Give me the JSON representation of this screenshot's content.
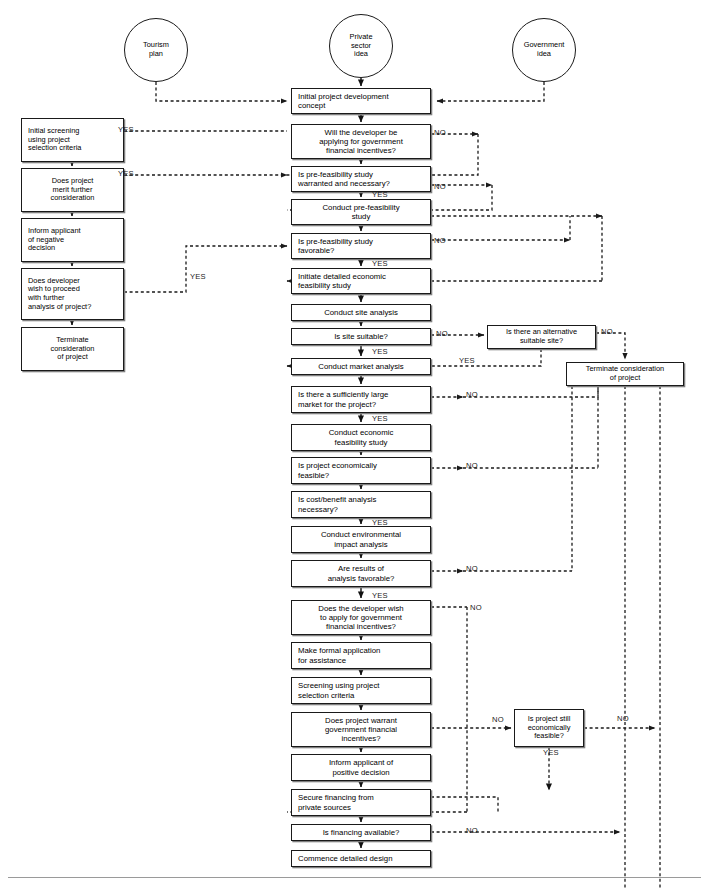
{
  "diagram": {
    "yes_label": "YES",
    "no_label": "NO"
  },
  "sources": [
    {
      "id": "tourism-plan",
      "label": "Tourism\nplan",
      "x": 124,
      "y": 18,
      "w": 64,
      "h": 64
    },
    {
      "id": "private-idea",
      "label": "Private\nsector\nidea",
      "x": 329,
      "y": 14,
      "w": 64,
      "h": 64
    },
    {
      "id": "government-idea",
      "label": "Government\nidea",
      "x": 512,
      "y": 18,
      "w": 64,
      "h": 64
    }
  ],
  "left_column": [
    {
      "id": "initial-screening",
      "label": "Initial screening\nusing project\nselection criteria",
      "x": 21,
      "y": 118,
      "w": 103,
      "h": 44,
      "align": "left"
    },
    {
      "id": "merit-consideration",
      "label": "Does project\nmerit further\nconsideration",
      "x": 21,
      "y": 168,
      "w": 103,
      "h": 44,
      "align": "center"
    },
    {
      "id": "inform-negative",
      "label": "Inform applicant\nof negative\ndecision",
      "x": 21,
      "y": 218,
      "w": 103,
      "h": 44,
      "align": "left"
    },
    {
      "id": "developer-proceed",
      "label": "Does developer\nwish to proceed\nwith further\nanalysis of project?",
      "x": 21,
      "y": 268,
      "w": 103,
      "h": 52,
      "align": "left"
    },
    {
      "id": "terminate-left",
      "label": "Terminate\nconsideration\nof project",
      "x": 21,
      "y": 327,
      "w": 103,
      "h": 44,
      "align": "center"
    }
  ],
  "main_column": [
    {
      "id": "initial-concept",
      "label": "Initial project development\nconcept",
      "x": 291,
      "y": 88,
      "w": 140,
      "h": 26,
      "align": "left"
    },
    {
      "id": "apply-incentives-q",
      "label": "Will the developer be\napplying for government\nfinancial incentives?",
      "x": 291,
      "y": 124,
      "w": 140,
      "h": 35,
      "align": "center"
    },
    {
      "id": "prefeas-warranted-q",
      "label": "Is pre-feasibility study\nwarranted and necessary?",
      "x": 291,
      "y": 166,
      "w": 140,
      "h": 26,
      "align": "left"
    },
    {
      "id": "conduct-prefeas",
      "label": "Conduct pre-feasibility\nstudy",
      "x": 291,
      "y": 199,
      "w": 140,
      "h": 26,
      "align": "center"
    },
    {
      "id": "prefeas-favorable-q",
      "label": "Is pre-feasibility study\nfavorable?",
      "x": 291,
      "y": 233,
      "w": 140,
      "h": 26,
      "align": "left"
    },
    {
      "id": "initiate-economic",
      "label": "Initiate detailed economic\nfeasibility study",
      "x": 291,
      "y": 268,
      "w": 140,
      "h": 26,
      "align": "left"
    },
    {
      "id": "conduct-site",
      "label": "Conduct site analysis",
      "x": 291,
      "y": 304,
      "w": 140,
      "h": 17,
      "align": "center"
    },
    {
      "id": "site-suitable-q",
      "label": "Is site suitable?",
      "x": 291,
      "y": 328,
      "w": 140,
      "h": 17,
      "align": "center"
    },
    {
      "id": "conduct-market",
      "label": "Conduct market analysis",
      "x": 291,
      "y": 358,
      "w": 140,
      "h": 17,
      "align": "center"
    },
    {
      "id": "market-large-q",
      "label": "Is there a sufficiently large\nmarket for the project?",
      "x": 291,
      "y": 386,
      "w": 140,
      "h": 27,
      "align": "left"
    },
    {
      "id": "conduct-econ-study",
      "label": "Conduct economic\nfeasibility study",
      "x": 291,
      "y": 424,
      "w": 140,
      "h": 27,
      "align": "center"
    },
    {
      "id": "econ-feasible-q",
      "label": "Is project economically\nfeasible?",
      "x": 291,
      "y": 457,
      "w": 140,
      "h": 27,
      "align": "left"
    },
    {
      "id": "costbenefit-q",
      "label": "Is cost/benefit analysis\nnecessary?",
      "x": 291,
      "y": 491,
      "w": 140,
      "h": 27,
      "align": "left"
    },
    {
      "id": "conduct-env",
      "label": "Conduct environmental\nimpact analysis",
      "x": 291,
      "y": 526,
      "w": 140,
      "h": 27,
      "align": "center"
    },
    {
      "id": "results-favorable-q",
      "label": "Are results of\nanalysis favorable?",
      "x": 291,
      "y": 560,
      "w": 140,
      "h": 27,
      "align": "center"
    },
    {
      "id": "apply-gov-incentives-q",
      "label": "Does the developer wish\nto apply for government\nfinancial incentives?",
      "x": 291,
      "y": 600,
      "w": 140,
      "h": 35,
      "align": "center"
    },
    {
      "id": "formal-application",
      "label": "Make formal application\nfor assistance",
      "x": 291,
      "y": 642,
      "w": 140,
      "h": 27,
      "align": "left"
    },
    {
      "id": "screening-criteria",
      "label": "Screening using project\nselection criteria",
      "x": 291,
      "y": 677,
      "w": 140,
      "h": 27,
      "align": "left"
    },
    {
      "id": "warrant-incentives-q",
      "label": "Does project warrant\ngovernment financial\nincentives?",
      "x": 291,
      "y": 712,
      "w": 140,
      "h": 35,
      "align": "center"
    },
    {
      "id": "inform-positive",
      "label": "Inform applicant of\npositive decision",
      "x": 291,
      "y": 754,
      "w": 140,
      "h": 27,
      "align": "center"
    },
    {
      "id": "secure-financing",
      "label": "Secure financing from\nprivate sources",
      "x": 291,
      "y": 789,
      "w": 140,
      "h": 27,
      "align": "left"
    },
    {
      "id": "financing-available-q",
      "label": "Is financing available?",
      "x": 291,
      "y": 824,
      "w": 140,
      "h": 17,
      "align": "center"
    },
    {
      "id": "commence-design",
      "label": "Commence detailed design",
      "x": 291,
      "y": 850,
      "w": 140,
      "h": 17,
      "align": "left"
    }
  ],
  "right_column": [
    {
      "id": "alternative-site-q",
      "label": "Is there an alternative\nsuitable site?",
      "x": 487,
      "y": 325,
      "w": 109,
      "h": 24,
      "align": "center"
    },
    {
      "id": "terminate-right",
      "label": "Terminate consideration\nof project",
      "x": 566,
      "y": 362,
      "w": 118,
      "h": 24,
      "align": "center"
    },
    {
      "id": "still-feasible-q",
      "label": "Is project still\neconomically\nfeasible?",
      "x": 514,
      "y": 709,
      "w": 70,
      "h": 38,
      "align": "center"
    }
  ],
  "edge_labels": [
    {
      "id": "yes-initial-screening",
      "text": "YES",
      "x": 118,
      "y": 125
    },
    {
      "id": "yes-merit",
      "text": "YES",
      "x": 118,
      "y": 169
    },
    {
      "id": "yes-developer-proceed",
      "text": "YES",
      "x": 190,
      "y": 272
    },
    {
      "id": "no-apply-incentives",
      "text": "NO",
      "x": 434,
      "y": 128
    },
    {
      "id": "no-prefeas-warranted",
      "text": "NO",
      "x": 434,
      "y": 182
    },
    {
      "id": "yes-prefeas-warranted",
      "text": "YES",
      "x": 372,
      "y": 190
    },
    {
      "id": "no-prefeas-favorable",
      "text": "NO",
      "x": 434,
      "y": 236
    },
    {
      "id": "yes-prefeas-favorable",
      "text": "YES",
      "x": 372,
      "y": 259
    },
    {
      "id": "no-site-suitable",
      "text": "NO",
      "x": 436,
      "y": 329
    },
    {
      "id": "yes-site-suitable",
      "text": "YES",
      "x": 372,
      "y": 347
    },
    {
      "id": "no-alternative-site",
      "text": "NO",
      "x": 601,
      "y": 327
    },
    {
      "id": "yes-alternative-site",
      "text": "YES",
      "x": 459,
      "y": 356
    },
    {
      "id": "no-market-large",
      "text": "NO",
      "x": 466,
      "y": 390
    },
    {
      "id": "yes-market-large",
      "text": "YES",
      "x": 372,
      "y": 414
    },
    {
      "id": "no-econ-feasible",
      "text": "NO",
      "x": 466,
      "y": 461
    },
    {
      "id": "yes-costbenefit",
      "text": "YES",
      "x": 372,
      "y": 518
    },
    {
      "id": "no-results-favorable",
      "text": "NO",
      "x": 466,
      "y": 564
    },
    {
      "id": "yes-results-favorable",
      "text": "YES",
      "x": 372,
      "y": 591
    },
    {
      "id": "no-apply-gov",
      "text": "NO",
      "x": 470,
      "y": 603
    },
    {
      "id": "no-warrant-incentives",
      "text": "NO",
      "x": 492,
      "y": 715
    },
    {
      "id": "no-still-feasible",
      "text": "NO",
      "x": 617,
      "y": 714
    },
    {
      "id": "yes-still-feasible",
      "text": "YES",
      "x": 543,
      "y": 748
    },
    {
      "id": "no-financing",
      "text": "NO",
      "x": 466,
      "y": 826
    }
  ],
  "colors": {
    "stroke": "#1a1a1a",
    "box_shadow": "#808080",
    "background": "#ffffff",
    "footer_rule": "#9a9a9a"
  }
}
